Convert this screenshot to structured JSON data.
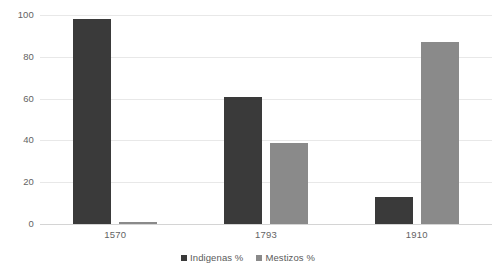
{
  "chart_data": {
    "type": "bar",
    "title": "",
    "subtitle": "",
    "xlabel": "",
    "ylabel": "",
    "categories": [
      "1570",
      "1793",
      "1910"
    ],
    "series": [
      {
        "name": "Indigenas %",
        "color": "#3a3a3a",
        "values": [
          98,
          61,
          13
        ]
      },
      {
        "name": "Mestizos %",
        "color": "#8a8a8a",
        "values": [
          1,
          39,
          87
        ]
      }
    ],
    "ylim": [
      0,
      100
    ],
    "yticks": [
      0,
      20,
      40,
      60,
      80,
      100
    ],
    "ytick_labels": [
      "0",
      "20",
      "40",
      "60",
      "80",
      "100"
    ],
    "grid": true,
    "grid_axis": "y",
    "grid_color": "#e8e8e8",
    "legend_position": "bottom",
    "background_color": "#ffffff",
    "bar_group_mode": "grouped"
  },
  "legend": {
    "items": [
      {
        "label": "Indigenas %",
        "swatch": "legend-swatch-dark"
      },
      {
        "label": "Mestizos %",
        "swatch": "legend-swatch-gray"
      }
    ]
  }
}
